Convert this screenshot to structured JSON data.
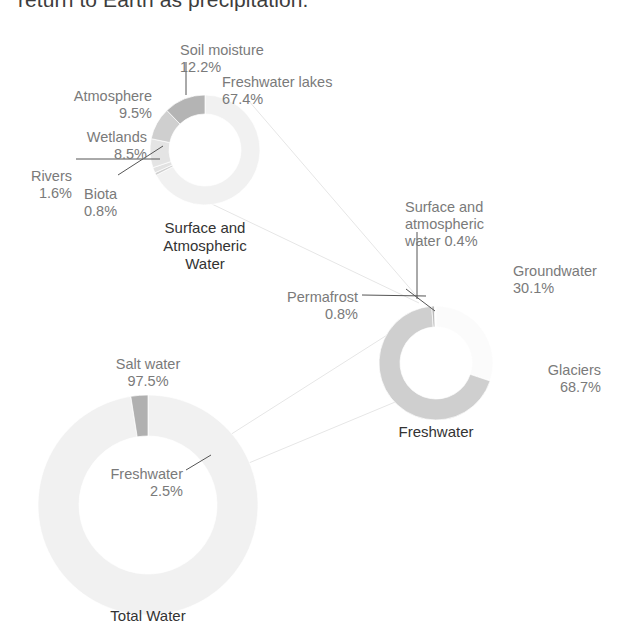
{
  "header": {
    "cut_off_line": "return to Earth as precipitation."
  },
  "colors": {
    "ink": "#333333",
    "label": "#7a7a7a",
    "leader": "#555555",
    "connector": "#e6e6e6",
    "pale": "#f1f1f1",
    "light": "#ececec",
    "mid": "#d9d9d9",
    "grey": "#c6c6c6",
    "dark": "#a9a9a9"
  },
  "chart_data": [
    {
      "type": "pie",
      "title": "Surface and\nAtmospheric\nWater",
      "center": [
        205,
        150
      ],
      "outer_r": 55,
      "inner_r": 36,
      "start_angle": -90,
      "categories": [
        "Freshwater lakes",
        "Biota",
        "Rivers",
        "Wetlands",
        "Atmosphere",
        "Soil moisture"
      ],
      "values": [
        67.4,
        0.8,
        1.6,
        8.5,
        9.5,
        12.2
      ],
      "slice_colors": [
        "#f1f1f1",
        "#d0d0d0",
        "#e2e2e2",
        "#e4e4e4",
        "#cfcfcf",
        "#b4b4b4"
      ],
      "labels": [
        {
          "name": "Freshwater lakes",
          "pct": "67.4%",
          "x": 222,
          "y": 74,
          "align": "left"
        },
        {
          "name": "Soil moisture",
          "pct": "12.2%",
          "x": 180,
          "y": 42,
          "align": "left"
        },
        {
          "name": "Atmosphere",
          "pct": "9.5%",
          "x": 152,
          "y": 88,
          "align": "right"
        },
        {
          "name": "Wetlands",
          "pct": "8.5%",
          "x": 147,
          "y": 129,
          "align": "right"
        },
        {
          "name": "Rivers",
          "pct": "1.6%",
          "x": 72,
          "y": 168,
          "align": "right"
        },
        {
          "name": "Biota",
          "pct": "0.8%",
          "x": 84,
          "y": 186,
          "align": "left"
        }
      ],
      "title_pos": [
        205,
        219
      ]
    },
    {
      "type": "pie",
      "title": "Freshwater",
      "center": [
        436,
        363
      ],
      "outer_r": 57,
      "inner_r": 36,
      "start_angle": -90,
      "categories": [
        "Groundwater",
        "Glaciers",
        "Permafrost",
        "Surface and atmospheric water"
      ],
      "values": [
        30.1,
        68.7,
        0.8,
        0.4
      ],
      "slice_colors": [
        "#fbfbfb",
        "#cfcfcf",
        "#b9b9b9",
        "#ffffff"
      ],
      "labels": [
        {
          "name": "Groundwater",
          "pct": "30.1%",
          "x": 513,
          "y": 263,
          "align": "left"
        },
        {
          "name": "Glaciers",
          "pct": "68.7%",
          "x": 601,
          "y": 362,
          "align": "right"
        },
        {
          "name": "Permafrost",
          "pct": "0.8%",
          "x": 358,
          "y": 289,
          "align": "right"
        },
        {
          "name": "Surface and\natmospheric\nwater 0.4%",
          "pct": "",
          "x": 405,
          "y": 199,
          "align": "left"
        }
      ],
      "title_pos": [
        436,
        423
      ]
    },
    {
      "type": "pie",
      "title": "Total Water",
      "center": [
        148,
        505
      ],
      "outer_r": 110,
      "inner_r": 69,
      "start_angle": -90,
      "categories": [
        "Salt water",
        "Freshwater"
      ],
      "values": [
        97.5,
        2.5
      ],
      "slice_colors": [
        "#f1f1f1",
        "#b0b0b0"
      ],
      "labels": [
        {
          "name": "Salt water",
          "pct": "97.5%",
          "x": 148,
          "y": 356,
          "align": "center"
        },
        {
          "name": "Freshwater",
          "pct": "2.5%",
          "x": 183,
          "y": 466,
          "align": "right"
        }
      ],
      "title_pos": [
        148,
        607
      ]
    }
  ],
  "leaders": [
    {
      "name": "soil-moisture-leader",
      "points": "186,62 186,95"
    },
    {
      "name": "rivers-leader",
      "points": "76,159 160,159"
    },
    {
      "name": "biota-leader",
      "points": "118,175 163,146"
    },
    {
      "name": "permafrost-leader",
      "points": "362,295 426,296"
    },
    {
      "name": "surface-atm-leader",
      "points": "417,232 417,299"
    },
    {
      "name": "surface-atm-tick",
      "points": "406,289 435,311"
    },
    {
      "name": "freshwater-2-5-leader",
      "points": "186,470 211,455"
    }
  ],
  "connectors": [
    {
      "name": "connector-surface-to-freshwater-a",
      "points": "248,100 420,300"
    },
    {
      "name": "connector-surface-to-freshwater-b",
      "points": "170,184 419,303"
    },
    {
      "name": "connector-totalwater-to-freshwater-a",
      "points": "222,440 395,330"
    },
    {
      "name": "connector-totalwater-to-freshwater-b",
      "points": "232,470 400,400"
    }
  ]
}
